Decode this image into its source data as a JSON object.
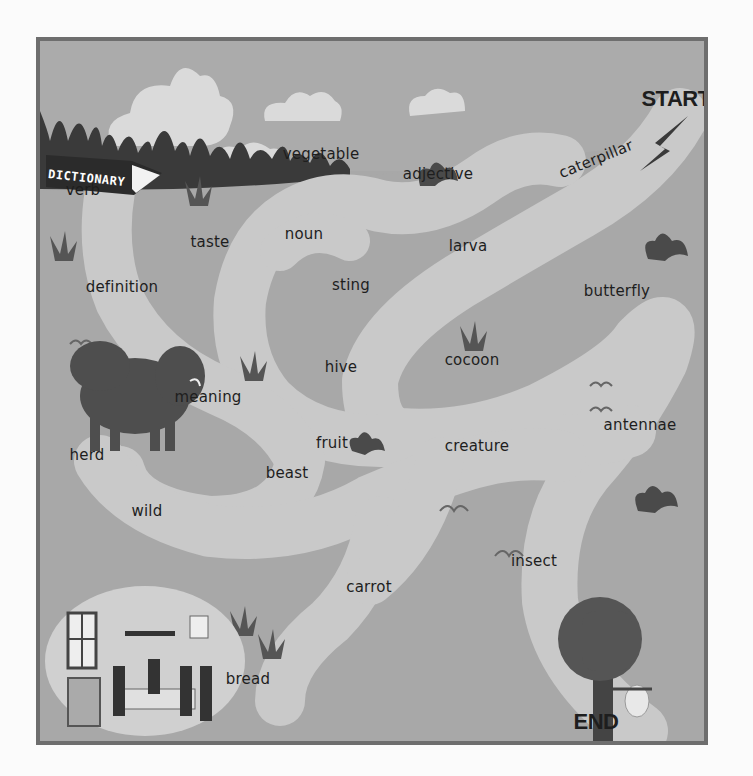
{
  "maze": {
    "start_label": "START",
    "end_label": "END",
    "book_label": "DICTIONARY",
    "words": [
      {
        "text": "caterpillar",
        "x": 592,
        "y": 155,
        "rotate": -22
      },
      {
        "text": "vegetable",
        "x": 317,
        "y": 150
      },
      {
        "text": "adjective",
        "x": 434,
        "y": 170
      },
      {
        "text": "verb",
        "x": 79,
        "y": 186
      },
      {
        "text": "noun",
        "x": 300,
        "y": 230
      },
      {
        "text": "taste",
        "x": 206,
        "y": 238
      },
      {
        "text": "larva",
        "x": 464,
        "y": 242
      },
      {
        "text": "definition",
        "x": 118,
        "y": 283
      },
      {
        "text": "sting",
        "x": 347,
        "y": 281
      },
      {
        "text": "butterfly",
        "x": 613,
        "y": 287
      },
      {
        "text": "cocoon",
        "x": 468,
        "y": 356
      },
      {
        "text": "hive",
        "x": 337,
        "y": 363
      },
      {
        "text": "meaning",
        "x": 204,
        "y": 393
      },
      {
        "text": "antennae",
        "x": 636,
        "y": 421
      },
      {
        "text": "fruit",
        "x": 328,
        "y": 439
      },
      {
        "text": "creature",
        "x": 473,
        "y": 442
      },
      {
        "text": "herd",
        "x": 83,
        "y": 451
      },
      {
        "text": "beast",
        "x": 283,
        "y": 469
      },
      {
        "text": "wild",
        "x": 143,
        "y": 507
      },
      {
        "text": "insect",
        "x": 530,
        "y": 557
      },
      {
        "text": "carrot",
        "x": 365,
        "y": 583
      },
      {
        "text": "bread",
        "x": 244,
        "y": 675
      }
    ]
  },
  "colors": {
    "ground": "#a8a8a8",
    "path": "#c9c9c9",
    "sky": "#ababab",
    "cloud": "#dadada",
    "bush": "#4a4a4a",
    "border": "#6e6e6e",
    "text": "#1e1e1e"
  }
}
